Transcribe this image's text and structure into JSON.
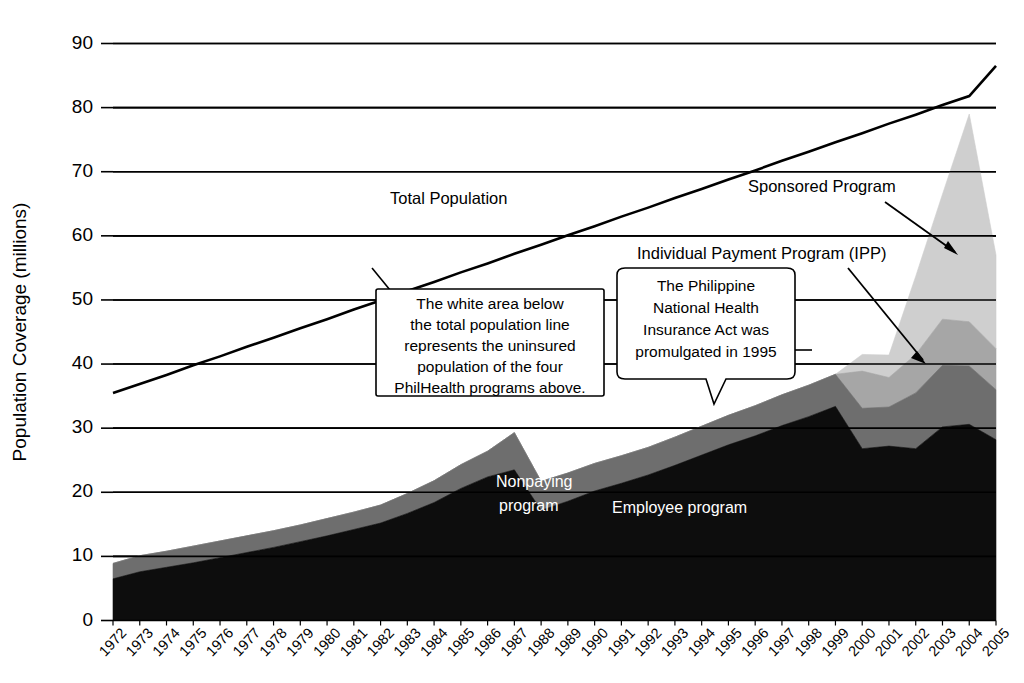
{
  "chart_data": {
    "type": "area",
    "title": "",
    "xlabel": "",
    "ylabel": "Population Coverage (millions)",
    "ylim": [
      0,
      90
    ],
    "yticks": [
      0,
      10,
      20,
      30,
      40,
      50,
      60,
      70,
      80,
      90
    ],
    "grid": true,
    "legend_position": "inline-annotations",
    "stacked": true,
    "categories": [
      "1972",
      "1973",
      "1974",
      "1975",
      "1976",
      "1977",
      "1978",
      "1979",
      "1980",
      "1981",
      "1982",
      "1983",
      "1984",
      "1985",
      "1986",
      "1987",
      "1988",
      "1989",
      "1990",
      "1991",
      "1992",
      "1993",
      "1994",
      "1995",
      "1996",
      "1997",
      "1998",
      "1999",
      "2000",
      "2001",
      "2002",
      "2003",
      "2004",
      "2005"
    ],
    "series": [
      {
        "name": "Employee program",
        "color": "#0d0d0d",
        "values": [
          6.5,
          7.6,
          8.3,
          9.0,
          9.8,
          10.6,
          11.4,
          12.3,
          13.2,
          14.2,
          15.2,
          16.7,
          18.4,
          20.6,
          22.4,
          23.5,
          17.2,
          18.6,
          20.2,
          21.4,
          22.7,
          24.2,
          25.8,
          27.4,
          28.8,
          30.4,
          31.8,
          33.4,
          26.8,
          27.2,
          26.8,
          30.2,
          30.6,
          28.2
        ]
      },
      {
        "name": "Nonpaying program",
        "color": "#6e6e6e",
        "values": [
          2.4,
          2.5,
          2.5,
          2.6,
          2.6,
          2.6,
          2.6,
          2.6,
          2.7,
          2.7,
          2.8,
          3.1,
          3.4,
          3.7,
          4.0,
          5.8,
          4.5,
          4.4,
          4.3,
          4.3,
          4.3,
          4.4,
          4.5,
          4.6,
          4.7,
          4.8,
          4.9,
          5.0,
          6.3,
          6.1,
          8.7,
          9.6,
          9.1,
          7.8
        ]
      },
      {
        "name": "Individual Payment Program (IPP)",
        "color": "#a6a6a6",
        "values": [
          0,
          0,
          0,
          0,
          0,
          0,
          0,
          0,
          0,
          0,
          0,
          0,
          0,
          0,
          0,
          0,
          0,
          0,
          0,
          0,
          0,
          0,
          0,
          0,
          0,
          0,
          0,
          0,
          5.8,
          4.6,
          6.0,
          7.2,
          6.9,
          6.4
        ]
      },
      {
        "name": "Sponsored Program",
        "color": "#cfcfcf",
        "values": [
          0,
          0,
          0,
          0,
          0,
          0,
          0,
          0,
          0,
          0,
          0,
          0,
          0,
          0,
          0,
          0,
          0,
          0,
          0,
          0,
          0,
          0,
          0,
          0,
          0,
          0,
          0,
          0,
          2.6,
          3.5,
          12.2,
          19.5,
          32.4,
          14.6
        ]
      }
    ],
    "total_population_line": {
      "name": "Total Population",
      "color": "#000000",
      "values": [
        35.5,
        36.9,
        38.3,
        39.8,
        41.2,
        42.7,
        44.1,
        45.6,
        47.0,
        48.5,
        49.9,
        51.4,
        52.8,
        54.3,
        55.7,
        57.2,
        58.6,
        60.1,
        61.5,
        63.0,
        64.4,
        65.9,
        67.3,
        68.8,
        70.2,
        71.7,
        73.1,
        74.6,
        76.0,
        77.5,
        78.9,
        80.4,
        81.8,
        86.5
      ]
    }
  },
  "axis": {
    "y_title": "Population Coverage (millions)",
    "y_ticks": [
      "0",
      "10",
      "20",
      "30",
      "40",
      "50",
      "60",
      "70",
      "80",
      "90"
    ],
    "x_ticks": [
      "1972",
      "1973",
      "1974",
      "1975",
      "1976",
      "1977",
      "1978",
      "1979",
      "1980",
      "1981",
      "1982",
      "1983",
      "1984",
      "1985",
      "1986",
      "1987",
      "1988",
      "1989",
      "1990",
      "1991",
      "1992",
      "1993",
      "1994",
      "1995",
      "1996",
      "1997",
      "1998",
      "1999",
      "2000",
      "2001",
      "2002",
      "2003",
      "2004",
      "2005"
    ]
  },
  "annotations": {
    "total_population": "Total Population",
    "sponsored_program": "Sponsored Program",
    "ipp": "Individual Payment Program (IPP)",
    "nonpaying_line1": "Nonpaying",
    "nonpaying_line2": "program",
    "employee_program": "Employee program",
    "callout_white_area": [
      "The white area below",
      "the total population line",
      "represents the uninsured",
      "population of the four",
      "PhilHealth programs above."
    ],
    "callout_act": [
      "The Philippine",
      "National Health",
      "Insurance Act was",
      "promulgated in 1995"
    ]
  },
  "colors": {
    "employee": "#0d0d0d",
    "nonpaying": "#6e6e6e",
    "ipp": "#a6a6a6",
    "sponsored": "#cfcfcf",
    "line": "#000000",
    "background": "#ffffff"
  }
}
